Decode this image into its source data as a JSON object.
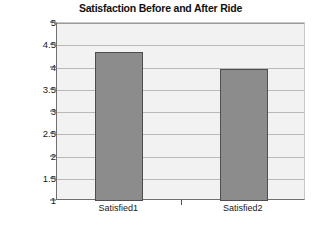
{
  "chart_data": {
    "type": "bar",
    "title": "Satisfaction Before and After Ride",
    "xlabel": "",
    "ylabel": "",
    "categories": [
      "Satisfied1",
      "Satisfied2"
    ],
    "values": [
      4.35,
      3.97
    ],
    "series": [
      {
        "name": "Satisfaction",
        "values": [
          4.35,
          3.97
        ]
      }
    ],
    "ylim": [
      1,
      5
    ],
    "y_ticks": [
      1,
      1.5,
      2,
      2.5,
      3,
      3.5,
      4,
      4.5,
      5
    ],
    "y_tick_labels": [
      "1",
      "1.5",
      "2",
      "2.5",
      "3",
      "3.5",
      "4",
      "4.5",
      "5"
    ],
    "grid": true,
    "legend": false,
    "legend_position": "none",
    "bar_color": "#8C8C8C",
    "bar_edge_color": "#4D4D4D",
    "plot_background": "#F2F2F2",
    "gridline_color": "#B9B9B9",
    "axis_color": "#6F6F6F"
  },
  "caption": {
    "text": ""
  }
}
